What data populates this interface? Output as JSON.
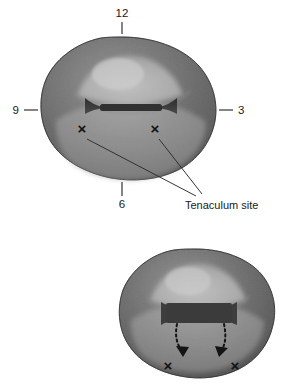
{
  "figure": {
    "background_color": "#ffffff",
    "panels": [
      {
        "id": "upper",
        "name": "cervix-clock-positions",
        "description": "Anterior view of cervix with clock-face orientation marks and tenaculum sites",
        "clock_labels": [
          {
            "label": "12",
            "position": "top"
          },
          {
            "label": "3",
            "position": "right"
          },
          {
            "label": "6",
            "position": "bottom"
          },
          {
            "label": "9",
            "position": "left"
          }
        ],
        "x_marks": [
          {
            "label": "×",
            "position": "left-inferior"
          },
          {
            "label": "×",
            "position": "right-inferior"
          }
        ],
        "callout": "Tenaculum site"
      },
      {
        "id": "lower",
        "name": "cervix-os-dilated",
        "description": "Cervix with widened os and traction arrows directed toward tenaculum sites",
        "x_marks": [
          {
            "label": "×",
            "position": "left-inferior"
          },
          {
            "label": "×",
            "position": "right-inferior"
          }
        ],
        "arrows": [
          {
            "name": "traction-arrow-left",
            "style": "dotted",
            "direction": "down-left"
          },
          {
            "name": "traction-arrow-right",
            "style": "dotted",
            "direction": "down-right"
          }
        ]
      }
    ]
  },
  "colors": {
    "tissue_mid": "#a9a9a9",
    "tissue_light": "#c2c2c2",
    "tissue_shadow": "#8d8d8d",
    "os_dark": "#3a3a3a",
    "ink": "#1a1a1a",
    "background": "#ffffff"
  }
}
